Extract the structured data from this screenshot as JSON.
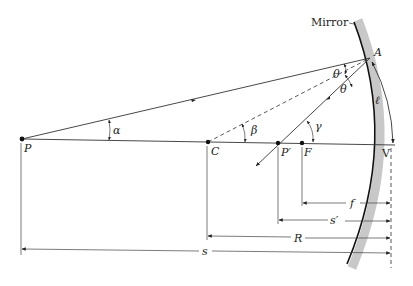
{
  "labels": {
    "mirror": "Mirror",
    "point_A": "A",
    "object_P": "P",
    "center_C": "C",
    "image_P_prime": "P′",
    "focal_F": "F",
    "vertex_V": "V",
    "arc_length": "ℓ",
    "angle_alpha": "α",
    "angle_beta": "β",
    "angle_gamma": "γ",
    "angle_theta_1": "θ",
    "angle_theta_2": "θ"
  },
  "dimensions": {
    "focal_length": "f",
    "image_distance": "s′",
    "radius": "R",
    "object_distance": "s"
  },
  "colors": {
    "mirror_band": "#c8c8c8",
    "mirror_surface": "#111111",
    "lines": "#333333"
  }
}
